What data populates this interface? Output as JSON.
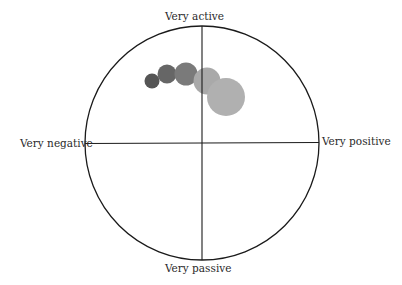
{
  "diagram": {
    "type": "affect-circumplex",
    "labels": {
      "top": "Very active",
      "bottom": "Very passive",
      "left": "Very negative",
      "right": "Very positive"
    },
    "colors": {
      "outline": "#1a1a1a",
      "background": "#ffffff"
    },
    "bubbles": [
      {
        "cx": 152,
        "cy": 81,
        "r": 7.5,
        "color": "#555555"
      },
      {
        "cx": 167,
        "cy": 74,
        "r": 9.5,
        "color": "#666666"
      },
      {
        "cx": 186,
        "cy": 74,
        "r": 11.5,
        "color": "#7a7a7a"
      },
      {
        "cx": 207,
        "cy": 81,
        "r": 13.5,
        "color": "#a9a9a9"
      },
      {
        "cx": 226,
        "cy": 97,
        "r": 19,
        "color": "#b0b0b0"
      }
    ]
  }
}
